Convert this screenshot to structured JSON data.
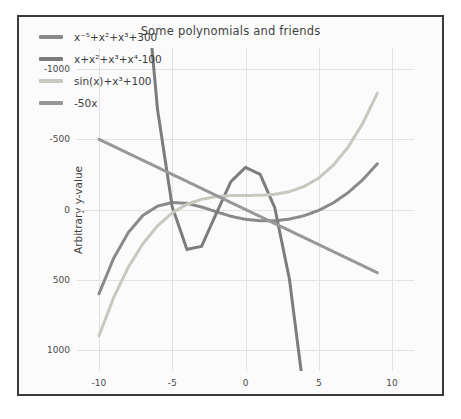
{
  "figure": {
    "title": "Some polynomials and friends",
    "background": "#fbfbfb",
    "border_color": "#3a3a3a"
  },
  "axes": {
    "ylabel": "Arbitrary y-value",
    "xlabel": "",
    "yticks": [
      "1000",
      "500",
      "0",
      "-500",
      "-1000"
    ],
    "xticks": [
      "-10",
      "-5",
      "0",
      "5",
      "10"
    ]
  },
  "legend": {
    "entries": [
      {
        "label": "x⁻⁵+x²+x³+300",
        "color": "#8a8a8a"
      },
      {
        "label": "x+x²+x³+x⁴-100",
        "color": "#7c7c7c"
      },
      {
        "label": "sin(x)+x³+100",
        "color": "#c9c7c0"
      },
      {
        "label": "-50x",
        "color": "#979797"
      }
    ]
  },
  "chart_data": {
    "type": "line",
    "title": "Some polynomials and friends",
    "xlabel": "",
    "ylabel": "Arbitrary y-value",
    "xlim": [
      -11.5,
      11.5
    ],
    "ylim": [
      -1150,
      1150
    ],
    "xticks": [
      -10,
      -5,
      0,
      5,
      10
    ],
    "yticks": [
      -1000,
      -500,
      0,
      500,
      1000
    ],
    "grid": true,
    "legend_position": "upper left",
    "x": [
      -10,
      -9,
      -8,
      -7,
      -6,
      -5,
      -4,
      -3,
      -2,
      -1,
      0,
      1,
      2,
      3,
      4,
      5,
      6,
      7,
      8,
      9
    ],
    "series": [
      {
        "name": "x⁻⁵+x²+x³+300",
        "color": "#8a8a8a",
        "values": [
          -600,
          -348,
          -164,
          -42,
          24,
          50,
          44,
          18,
          -16,
          -48,
          -70,
          -80,
          -80,
          -68,
          -44,
          -6,
          48,
          120,
          212,
          326
        ]
      },
      {
        "name": "x+x²+x³+x⁴-100",
        "color": "#7c7c7c",
        "values": [
          8790,
          5786,
          3508,
          1850,
          710,
          20,
          -284,
          -262,
          -30,
          198,
          300,
          250,
          12,
          -498,
          -1316,
          -2520,
          -4188,
          -6398,
          -9228,
          -12756
        ]
      },
      {
        "name": "sin(x)+x³+100",
        "color": "#c9c7c0",
        "values": [
          -899,
          -628,
          -411,
          -243,
          -116,
          -24,
          37,
          73,
          92,
          99,
          100,
          101,
          108,
          127,
          164,
          224,
          316,
          444,
          613,
          829
        ]
      },
      {
        "name": "-50x",
        "color": "#979797",
        "values": [
          500,
          450,
          400,
          350,
          300,
          250,
          200,
          150,
          100,
          50,
          0,
          -50,
          -100,
          -150,
          -200,
          -250,
          -300,
          -350,
          -400,
          -450
        ]
      }
    ]
  }
}
